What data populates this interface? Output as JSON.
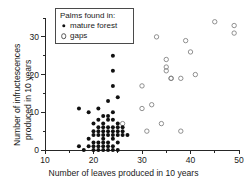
{
  "figure": {
    "name": "palm-reproduction-scatter",
    "background": "#ffffff",
    "point_color_closed": "#111111",
    "point_color_open": "#7d7d7d",
    "axis_color": "#262626"
  },
  "legend": {
    "title": "Palms found in:",
    "entries": [
      {
        "label": "mature forest",
        "marker": "filled-circle"
      },
      {
        "label": "gaps",
        "marker": "open-circle"
      }
    ]
  },
  "axes": {
    "x": {
      "label": "Number of leaves produced in 10 years",
      "ticks": [
        10,
        20,
        30,
        40,
        50
      ],
      "tick_labels": [
        "10",
        "20",
        "30",
        "40",
        "50"
      ],
      "minor_ticks": [
        15,
        25,
        35,
        45
      ],
      "range": [
        10,
        50
      ]
    },
    "y": {
      "label_line1": "Number of infructescences",
      "label_line2": "produced in 10 years",
      "ticks": [
        0,
        10,
        20,
        30
      ],
      "tick_labels": [
        "0",
        "10",
        "20",
        "30"
      ],
      "minor_ticks": [
        5,
        15,
        25,
        35
      ],
      "range": [
        0,
        35
      ]
    }
  },
  "chart_data": {
    "type": "scatter",
    "title": "",
    "xlabel": "Number of leaves produced in 10 years",
    "ylabel": "Number of infructescences produced in 10 years",
    "xlim": [
      10,
      50
    ],
    "ylim": [
      0,
      35
    ],
    "grid": false,
    "legend_position": "top-left-inside",
    "series": [
      {
        "name": "mature forest",
        "marker": "filled-circle",
        "color": "#111111",
        "points": [
          [
            17,
            11
          ],
          [
            17,
            1
          ],
          [
            18,
            0
          ],
          [
            19,
            10
          ],
          [
            19,
            3
          ],
          [
            20,
            7
          ],
          [
            20,
            5
          ],
          [
            20,
            4
          ],
          [
            20,
            1
          ],
          [
            20,
            0
          ],
          [
            21,
            11
          ],
          [
            21,
            8
          ],
          [
            21,
            6
          ],
          [
            21,
            5
          ],
          [
            21,
            2
          ],
          [
            21,
            1
          ],
          [
            21,
            0
          ],
          [
            22,
            9
          ],
          [
            22,
            7
          ],
          [
            22,
            6
          ],
          [
            22,
            5
          ],
          [
            22,
            4
          ],
          [
            22,
            3
          ],
          [
            22,
            1
          ],
          [
            22,
            0
          ],
          [
            23,
            13
          ],
          [
            23,
            8
          ],
          [
            23,
            6
          ],
          [
            23,
            5
          ],
          [
            23,
            4
          ],
          [
            23,
            2
          ],
          [
            23,
            1
          ],
          [
            23,
            0
          ],
          [
            24,
            25
          ],
          [
            24,
            21
          ],
          [
            24,
            17
          ],
          [
            24,
            10
          ],
          [
            24,
            8
          ],
          [
            24,
            6
          ],
          [
            24,
            5
          ],
          [
            24,
            4
          ],
          [
            24,
            3
          ],
          [
            24,
            1
          ],
          [
            24,
            0
          ],
          [
            25,
            14
          ],
          [
            25,
            7
          ],
          [
            25,
            6
          ],
          [
            25,
            5
          ],
          [
            25,
            4
          ],
          [
            25,
            2
          ],
          [
            25,
            0
          ],
          [
            26,
            6
          ],
          [
            26,
            5
          ],
          [
            26,
            4
          ],
          [
            27,
            4
          ],
          [
            19,
            1
          ],
          [
            23,
            9
          ],
          [
            22,
            2
          ],
          [
            20,
            2
          ],
          [
            21,
            4
          ]
        ]
      },
      {
        "name": "gaps",
        "marker": "open-circle",
        "color": "#7d7d7d",
        "points": [
          [
            26,
            7
          ],
          [
            30,
            17
          ],
          [
            30,
            11
          ],
          [
            31,
            5
          ],
          [
            32,
            12
          ],
          [
            33,
            30
          ],
          [
            34,
            7
          ],
          [
            35,
            24
          ],
          [
            35,
            22
          ],
          [
            35,
            21
          ],
          [
            36,
            19
          ],
          [
            36,
            19
          ],
          [
            38,
            19
          ],
          [
            38,
            5
          ],
          [
            39,
            29
          ],
          [
            40,
            26
          ],
          [
            41,
            20
          ],
          [
            45,
            34
          ],
          [
            49,
            33
          ],
          [
            49,
            31
          ]
        ]
      }
    ]
  }
}
